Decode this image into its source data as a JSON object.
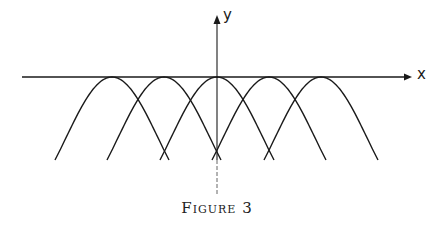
{
  "figure": {
    "caption": "Figure 3",
    "x_axis_label": "x",
    "y_axis_label": "y",
    "colors": {
      "ink": "#1a1a1a",
      "background": "#ffffff"
    }
  },
  "diagram": {
    "curve_count": 5,
    "peaks_px": [
      112,
      164,
      217,
      269,
      321
    ],
    "peak_y_px": 77,
    "half_width_px": 57,
    "bottom_y_px": 160,
    "x_axis": {
      "x1": 22,
      "x2": 412,
      "y": 77
    },
    "y_axis": {
      "x": 217,
      "y_top": 16,
      "y_bottom": 195
    }
  }
}
